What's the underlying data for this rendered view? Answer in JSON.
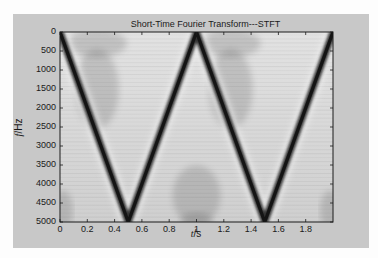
{
  "chart_data": {
    "type": "heatmap",
    "title": "Short-Time Fourier Transform---STFT",
    "xlabel": "t/s",
    "xlabel_var": "t",
    "xlabel_unit": "/s",
    "ylabel": "f/Hz",
    "ylabel_var": "f",
    "ylabel_unit": "/Hz",
    "xlim": [
      0,
      2
    ],
    "ylim": [
      0,
      5000
    ],
    "y_inverted": true,
    "x_ticks": [
      "0",
      "0.2",
      "0.4",
      "0.6",
      "0.8",
      "1",
      "1.2",
      "1.4",
      "1.6",
      "1.8"
    ],
    "x_tick_values": [
      0,
      0.2,
      0.4,
      0.6,
      0.8,
      1.0,
      1.2,
      1.4,
      1.6,
      1.8
    ],
    "y_ticks": [
      "0",
      "500",
      "1000",
      "1500",
      "2000",
      "2500",
      "3000",
      "3500",
      "4000",
      "4500",
      "5000"
    ],
    "y_tick_values": [
      0,
      500,
      1000,
      1500,
      2000,
      2500,
      3000,
      3500,
      4000,
      4500,
      5000
    ],
    "colormap": "gray (dark = high magnitude)",
    "grid": false,
    "legend": null,
    "ridge": {
      "description": "Triangular frequency sweep (instantaneous frequency of signal)",
      "t": [
        0,
        0.5,
        1.0,
        1.5,
        2.0
      ],
      "f": [
        0,
        5000,
        0,
        5000,
        0
      ]
    }
  },
  "colors": {
    "figure_bg": "#c8c8c8",
    "page_bg": "#fdfdfd",
    "plot_bg": "#d4d4d4",
    "ridge": "#141414",
    "axis": "#1a1a1a"
  }
}
